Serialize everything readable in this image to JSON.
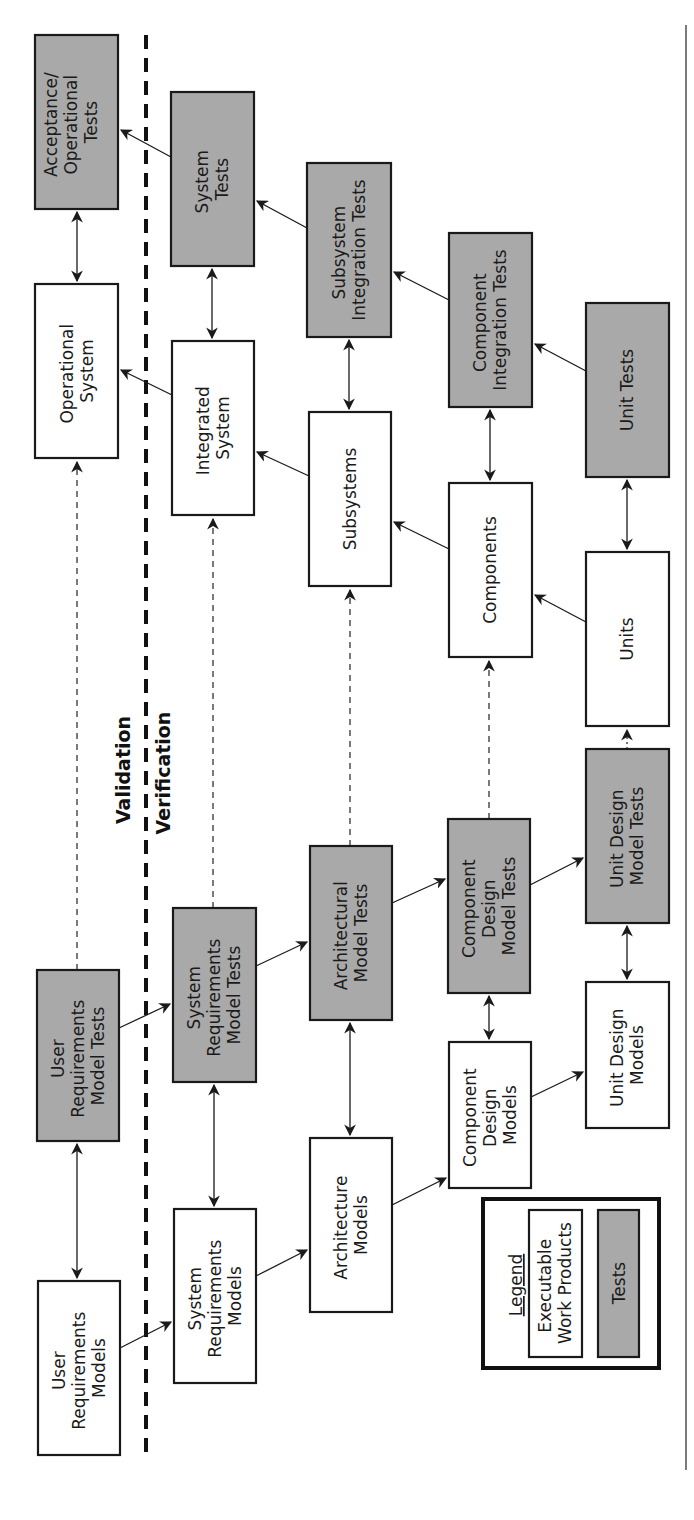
{
  "diagram": {
    "type": "V-model verification and validation flow (rotated 90 degrees)",
    "region_labels": {
      "validation": "Validation",
      "verification": "Verification"
    },
    "boxes": {
      "acceptance_tests": {
        "lines": [
          "Acceptance/",
          "Operational",
          "Tests"
        ],
        "kind": "test"
      },
      "operational_system": {
        "lines": [
          "Operational",
          "System"
        ],
        "kind": "work-product"
      },
      "user_req_model_tests": {
        "lines": [
          "User",
          "Requirements",
          "Model Tests"
        ],
        "kind": "test"
      },
      "user_req_models": {
        "lines": [
          "User",
          "Requirements",
          "Models"
        ],
        "kind": "work-product"
      },
      "system_tests": {
        "lines": [
          "System",
          "Tests"
        ],
        "kind": "test"
      },
      "integrated_system": {
        "lines": [
          "Integrated",
          "System"
        ],
        "kind": "work-product"
      },
      "sys_req_model_tests": {
        "lines": [
          "System",
          "Requirements",
          "Model Tests"
        ],
        "kind": "test"
      },
      "sys_req_models": {
        "lines": [
          "System",
          "Requirements",
          "Models"
        ],
        "kind": "work-product"
      },
      "subsystem_integration_tests": {
        "lines": [
          "Subsystem",
          "Integration Tests"
        ],
        "kind": "test"
      },
      "subsystems": {
        "lines": [
          "Subsystems"
        ],
        "kind": "work-product"
      },
      "architectural_model_tests": {
        "lines": [
          "Architectural",
          "Model Tests"
        ],
        "kind": "test"
      },
      "architecture_models": {
        "lines": [
          "Architecture",
          "Models"
        ],
        "kind": "work-product"
      },
      "component_integration_tests": {
        "lines": [
          "Component",
          "Integration Tests"
        ],
        "kind": "test"
      },
      "components": {
        "lines": [
          "Components"
        ],
        "kind": "work-product"
      },
      "component_design_model_tests": {
        "lines": [
          "Component",
          "Design",
          "Model Tests"
        ],
        "kind": "test"
      },
      "component_design_models": {
        "lines": [
          "Component",
          "Design",
          "Models"
        ],
        "kind": "work-product"
      },
      "unit_tests": {
        "lines": [
          "Unit Tests"
        ],
        "kind": "test"
      },
      "units": {
        "lines": [
          "Units"
        ],
        "kind": "work-product"
      },
      "unit_design_model_tests": {
        "lines": [
          "Unit Design",
          "Model Tests"
        ],
        "kind": "test"
      },
      "unit_design_models": {
        "lines": [
          "Unit Design",
          "Models"
        ],
        "kind": "work-product"
      }
    },
    "legend": {
      "title": "Legend",
      "items": [
        {
          "lines": [
            "Executable",
            "Work Products"
          ],
          "kind": "work-product"
        },
        {
          "lines": [
            "Tests"
          ],
          "kind": "test"
        }
      ]
    },
    "colors": {
      "test_fill": "#a9a9a9",
      "work_product_fill": "#ffffff",
      "stroke": "#1a1a1a"
    }
  }
}
